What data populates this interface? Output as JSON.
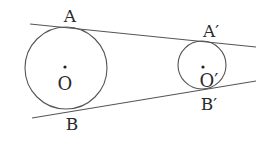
{
  "diagram": {
    "stroke_color": "#555555",
    "label_color": "#2a2a2a",
    "circles": [
      {
        "name": "O",
        "cx": 66,
        "cy": 68,
        "r": 41
      },
      {
        "name": "O'",
        "cx": 202,
        "cy": 65,
        "r": 24
      }
    ],
    "tangents": [
      {
        "name": "upper-tangent",
        "x1": 30,
        "y1": 24,
        "x2": 256,
        "y2": 47
      },
      {
        "name": "lower-tangent",
        "x1": 32,
        "y1": 118,
        "x2": 256,
        "y2": 81
      }
    ],
    "points": [
      {
        "name": "O-center",
        "x": 65,
        "y": 67
      },
      {
        "name": "O-prime-center",
        "x": 203,
        "y": 67
      }
    ],
    "labels": {
      "A": "A",
      "B": "B",
      "A_prime": "A′",
      "B_prime": "B′",
      "O": "O",
      "O_prime": "O′"
    }
  }
}
